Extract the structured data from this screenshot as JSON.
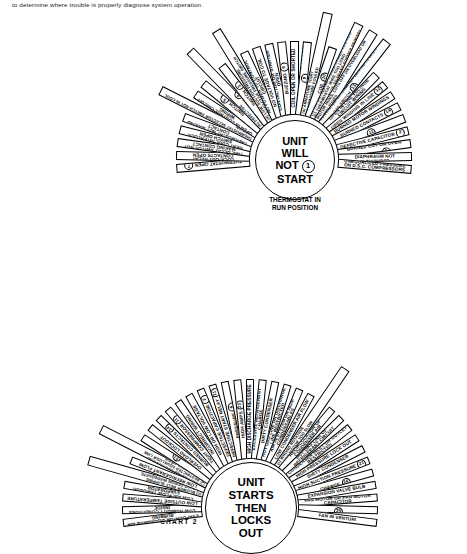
{
  "page": {
    "top_note": "to determine where trouble is properly diagnose system operation."
  },
  "chart1": {
    "label": "CHART 1",
    "hub_lines": [
      "UNIT",
      "WILL",
      "NOT",
      "START"
    ],
    "hub_badge": "1",
    "caption": "THERMOSTAT IN\nRUN POSITION",
    "segments": [
      {
        "text": "COMPR INTERNAL THERMOSTAT OPEN",
        "num": "7"
      },
      {
        "text": "LOCK-OUT RELAY CONTACTS OPEN",
        "num": ""
      },
      {
        "text": "TIME DELAY SWITCH NOT MAKING CONTACT",
        "num": ""
      },
      {
        "text": "HEAT COOL INTERLOCK SWITCH OPEN",
        "num": ""
      },
      {
        "text": "THERMOSTAT NOT MAKING CONTACT",
        "num": ""
      },
      {
        "text": "THERMOSTAT SELECTOR SWITCH NOT IN COOL POSITION",
        "num": ""
      },
      {
        "text": "OPEN IN CONTROL CIRCUIT WIRING",
        "num": ""
      },
      {
        "text": "OPEN HIGH PRESSURE SWITCH",
        "num": "5"
      },
      {
        "text": "(a) EXCESSIVE\n(b) DEFECTIVE\nPRESS SWITCH",
        "num": "4"
      },
      {
        "text": "OPEN LOW PRESSURE SWITCH",
        "num": "3"
      },
      {
        "text": "(a) LOW SUCTION PRESSURE\n(b) DEFECTIVE PRESSURE SWITCH",
        "num": ""
      },
      {
        "text": "NO POWER TO CONTROL CIRCUIT",
        "num": ""
      },
      {
        "text": "NO VOLTAGE TO COIL",
        "num": ""
      },
      {
        "text": "CONTACTOR OR STARTER OPEN",
        "num": ""
      },
      {
        "text": "BUZZING",
        "num": "8"
      },
      {
        "text": "COIL OPEN OR SHORTED",
        "num": ""
      },
      {
        "text": "NORMAL VOLTAGE TO COIL",
        "num": "9"
      },
      {
        "text": "(a) ARMATURE TIGHT\n(b) ARMATURE FOULED",
        "num": ""
      },
      {
        "text": "SUB-NORMAL VOLTAGE TO COIL",
        "num": "10"
      },
      {
        "text": "(a) V.A. RATING ON TRANSFORMER TOO LOW\n(b) THERMOSTAT WIRE TOO LONG\n(c) LOW VOLTAGE TO TRANS-FORMER PRIMARY",
        "num": ""
      },
      {
        "text": "MOTOR HUMS, CUTS OFF ON OVERLOAD OR BLOWS FUSES",
        "num": ""
      },
      {
        "text": "CONTACTOR OR STARTER CONTACTS OPEN OVERLOAD SWITCH",
        "num": "13"
      },
      {
        "text": "OPEN IN LINE VOLTAGE CIRCUIT WIRING",
        "num": ""
      },
      {
        "text": "OPEN WINDING IN LINE",
        "num": "12"
      },
      {
        "text": "BURNED MOTOR WINDINGS",
        "num": ""
      },
      {
        "text": "BURNED CONTACTS",
        "num": "14"
      },
      {
        "text": "DEFECTIVE START RELAY",
        "num": "11"
      },
      {
        "text": "DEFECTIVE CAPACITOR",
        "num": "2"
      },
      {
        "text": "COMPRESSOR STUCK, BURNED OUT OR OPEN WINDING",
        "num": "6"
      },
      {
        "text": "QUICK CONNECT DIAPHRAGM NOT PUNCTURED",
        "num": ""
      },
      {
        "text": "UNEQUALIZED PRESSURE ON D.S.C. COMPRESSORS",
        "num": ""
      }
    ]
  },
  "chart2": {
    "label": "CHART 2",
    "hub_lines": [
      "UNIT",
      "STARTS",
      "THEN",
      "LOCKS",
      "OUT"
    ],
    "segments": [
      {
        "text": "EVAPORATOR DISCHARGE AIR RUBBING",
        "num": ""
      },
      {
        "text": "LOW HUMIDITY CONDITIONS INSIDE",
        "num": ""
      },
      {
        "text": "LOW OUTSIDE TEMPERATURE",
        "num": ""
      },
      {
        "text": "LOW AIR FLOW THROUGH EVAPORATOR",
        "num": ""
      },
      {
        "text": "(a) BLOWER MOTOR OVERLOADED\n(b) BLOWER ROTATION WRONG\n(c) BLOWER BELT SLIPPING\n(d) DUCT DESIGN INADEQUATE\n(e) DIRTY FILTER OR FROSTING\n(f) BLOCKED GRILLES OR REGISTERS",
        "num": ""
      },
      {
        "text": "LOW REFRIGERANT FLOW",
        "num": ""
      },
      {
        "text": "(a) RESTRICTED EVAPORATOR\n(b) RESTRICTED EXPANSION VALVE\n(c) RESTRICTED SUCTION LINE\n(d) RESTRICTED EQUALIZER LINE\n(e) RESTRICTED DRIER\n(f) DEFECTIVE EXP VALVE\n(g) RESTRICTED CAP TUBE",
        "num": ""
      },
      {
        "text": "LOW PRESSURE LOCK OUT",
        "num": "21"
      },
      {
        "text": "OVERLOAD LOCKOUT",
        "num": ""
      },
      {
        "text": "BURNED CONTACTS",
        "num": "14"
      },
      {
        "text": "TIGHT COMPRESSOR",
        "num": "11"
      },
      {
        "text": "INCORRECT WIRING",
        "num": ""
      },
      {
        "text": "HIGH OR LOW VOLTAGE",
        "num": ""
      },
      {
        "text": "DEFECTIVE CAPACITOR",
        "num": "2"
      },
      {
        "text": "DEFECTIVE START RELAY",
        "num": "11"
      },
      {
        "text": "EXCESSIVE DISCHARGE PRESSURE",
        "num": "6"
      },
      {
        "text": "HIGH AMPS",
        "num": "21"
      },
      {
        "text": "HIGH DISCHARGE PRESSURE",
        "num": ""
      },
      {
        "text": "EXCESSIVE REFRIGERANT CHARGE",
        "num": ""
      },
      {
        "text": "DIRTY CONDENSER",
        "num": ""
      },
      {
        "text": "HOT GAS LINE OR DISCHARGE LINE RESTRICTED",
        "num": ""
      },
      {
        "text": "AIR IN SYSTEM OR NON-CONDENSABLES",
        "num": ""
      },
      {
        "text": "LOW CONDENSER AIR FLOW",
        "num": ""
      },
      {
        "text": "(a) LOOSE FAN ON SHAFT\n(b) IMPROPER LOCATION\n(c) WRONG ROTATION\n(d) FAN MOTOR TOO SLOW\n(e) DEFECTIVE FAN MOTOR\n(f) POOR INSTALLATION",
        "num": ""
      },
      {
        "text": "RECIRCULATION OF CONDENSER AIR",
        "num": ""
      },
      {
        "text": "HOT GAS LINE OF REFRIGERANT CIRCUIT",
        "num": ""
      },
      {
        "text": "CONDENSER INLET OR OUTLET RESTRICTED",
        "num": ""
      },
      {
        "text": "HIGH PRESSURE LOCK OUT",
        "num": ""
      },
      {
        "text": "DIRTY CONDENSER",
        "num": ""
      },
      {
        "text": "HIGH SUCTION PRESSURE",
        "num": "21"
      },
      {
        "text": "EXCESSIVE REFRIGERANT CHARGE",
        "num": "24"
      },
      {
        "text": "EXPANSION VALVE BULB",
        "num": ""
      },
      {
        "text": "FAN MOTOR OR FAN MOTOR CAPACITOR",
        "num": ""
      },
      {
        "text": "NOT FAN MOTOR PROPERLY",
        "num": "25"
      },
      {
        "text": "FAN IN VENTURI",
        "num": ""
      }
    ]
  }
}
